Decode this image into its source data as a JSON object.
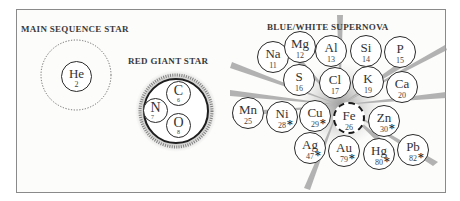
{
  "diagram": {
    "sections": {
      "main_sequence": {
        "title": "MAIN SEQUENCE STAR",
        "elements": [
          {
            "symbol": "He",
            "number": "2"
          }
        ]
      },
      "red_giant": {
        "title": "RED GIANT STAR",
        "elements": [
          {
            "symbol": "C",
            "number": "6"
          },
          {
            "symbol": "N",
            "number": "7"
          },
          {
            "symbol": "O",
            "number": "8"
          }
        ]
      },
      "supernova": {
        "title": "BLUE/WHITE SUPERNOVA",
        "elements": [
          {
            "symbol": "Na",
            "number": "11",
            "marked": false
          },
          {
            "symbol": "Mg",
            "number": "12",
            "marked": false
          },
          {
            "symbol": "Al",
            "number": "13",
            "marked": false
          },
          {
            "symbol": "Si",
            "number": "14",
            "marked": false
          },
          {
            "symbol": "P",
            "number": "15",
            "marked": false
          },
          {
            "symbol": "S",
            "number": "16",
            "marked": false
          },
          {
            "symbol": "Cl",
            "number": "17",
            "marked": false
          },
          {
            "symbol": "K",
            "number": "19",
            "marked": false
          },
          {
            "symbol": "Ca",
            "number": "20",
            "marked": false
          },
          {
            "symbol": "Mn",
            "number": "25",
            "marked": false
          },
          {
            "symbol": "Ni",
            "number": "28",
            "marked": true
          },
          {
            "symbol": "Cu",
            "number": "29",
            "marked": true
          },
          {
            "symbol": "Fe",
            "number": "26",
            "marked": false,
            "dashed": true
          },
          {
            "symbol": "Zn",
            "number": "30",
            "marked": true
          },
          {
            "symbol": "Ag",
            "number": "47",
            "marked": true
          },
          {
            "symbol": "Au",
            "number": "79",
            "marked": true
          },
          {
            "symbol": "Hg",
            "number": "80",
            "marked": true
          },
          {
            "symbol": "Pb",
            "number": "82",
            "marked": true
          }
        ]
      }
    },
    "marker_symbol": "*",
    "colors": {
      "outline": "#2a2a2a",
      "burst": "#9a9a9a",
      "frame": "#8a8a8a",
      "title": "#3a3a3a"
    }
  }
}
